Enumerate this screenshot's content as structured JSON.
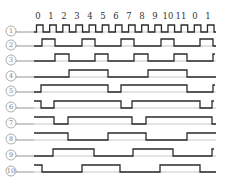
{
  "diagram": {
    "type": "timing-diagram",
    "clock_tick_labels": [
      "0",
      "1",
      "2",
      "3",
      "4",
      "5",
      "6",
      "7",
      "8",
      "9",
      "10",
      "11",
      "0",
      "1"
    ],
    "clock_tick_x": [
      38,
      51,
      64,
      77,
      90,
      103,
      116,
      129,
      142,
      155,
      168,
      181,
      195,
      208
    ],
    "x_start": 34,
    "x_end": 216,
    "pulse_height": 7,
    "colors": {
      "wave": "#2b2b2b",
      "baseline": "#b8b8b8",
      "label": "#777777"
    },
    "rows": [
      {
        "label": "①",
        "y": 32,
        "kind": "clock",
        "start_high": false,
        "transitions": []
      },
      {
        "label": "②",
        "y": 46,
        "start_high": false,
        "transitions": [
          42,
          55,
          82,
          95,
          121,
          134,
          161,
          174,
          200,
          213
        ]
      },
      {
        "label": "③",
        "y": 61,
        "start_high": false,
        "transitions": [
          55,
          69,
          95,
          108,
          134,
          148,
          174,
          187,
          213
        ]
      },
      {
        "label": "④",
        "y": 77,
        "start_high": false,
        "transitions": [
          69,
          108,
          148,
          187
        ]
      },
      {
        "label": "⑤",
        "y": 92,
        "start_high": false,
        "transitions": [
          41,
          108,
          121,
          187,
          213
        ]
      },
      {
        "label": "⑥",
        "y": 108,
        "start_high": true,
        "transitions": [
          41,
          54,
          121,
          132,
          200,
          212
        ]
      },
      {
        "label": "⑦",
        "y": 124,
        "start_high": true,
        "transitions": [
          54,
          68,
          132,
          146,
          212
        ]
      },
      {
        "label": "⑧",
        "y": 140,
        "start_high": true,
        "transitions": [
          68,
          108,
          146,
          187
        ]
      },
      {
        "label": "⑨",
        "y": 156,
        "start_high": false,
        "transitions": [
          53,
          94,
          133,
          173,
          212
        ]
      },
      {
        "label": "⑩",
        "y": 172,
        "start_high": true,
        "transitions": [
          42,
          82,
          120,
          160,
          200
        ]
      }
    ]
  }
}
